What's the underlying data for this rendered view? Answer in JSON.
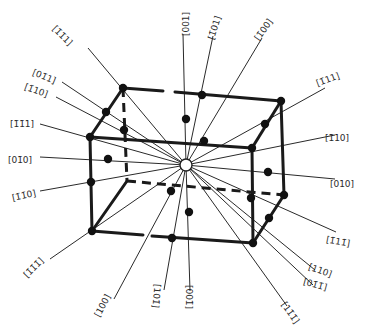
{
  "diagram": {
    "center": {
      "x": 186,
      "y": 165
    },
    "box": {
      "vertices": {
        "back_top_left": [
          123,
          88
        ],
        "back_top_right": [
          281,
          101
        ],
        "front_top_left": [
          90,
          137
        ],
        "front_top_right": [
          252,
          148
        ],
        "front_bottom_left": [
          92,
          231
        ],
        "front_bottom_right": [
          253,
          243
        ],
        "back_bottom_right": [
          284,
          195
        ],
        "back_bottom_left": [
          127,
          181
        ]
      }
    },
    "directions": [
      {
        "label": "[1̄1̄1]",
        "end": [
          88,
          48
        ],
        "lx": 62,
        "ly": 36,
        "rot": 45
      },
      {
        "label": "[01̄1]",
        "end": [
          62,
          82
        ],
        "lx": 44,
        "ly": 77,
        "rot": 22
      },
      {
        "label": "[1̄10]",
        "end": [
          56,
          97
        ],
        "lx": 36,
        "ly": 91,
        "rot": 20
      },
      {
        "label": "[1̄1̄1]",
        "end": [
          40,
          124
        ],
        "lx": 22,
        "ly": 124,
        "rot": 0
      },
      {
        "label": "[01̄0]",
        "end": [
          40,
          157
        ],
        "lx": 20,
        "ly": 160,
        "rot": 0
      },
      {
        "label": "[1̄1̄0]",
        "end": [
          40,
          191
        ],
        "lx": 24,
        "ly": 196,
        "rot": -12
      },
      {
        "label": "[1̄1̄1̄]",
        "end": [
          50,
          259
        ],
        "lx": 34,
        "ly": 268,
        "rot": -45
      },
      {
        "label": "[100]",
        "end": [
          114,
          299
        ],
        "lx": 103,
        "ly": 306,
        "rot": -62
      },
      {
        "label": "[101̄]",
        "end": [
          164,
          290
        ],
        "lx": 156,
        "ly": 296,
        "rot": 95
      },
      {
        "label": "[001̄]",
        "end": [
          190,
          291
        ],
        "lx": 188,
        "ly": 297,
        "rot": 90
      },
      {
        "label": "[11̄1̄]",
        "end": [
          287,
          306
        ],
        "lx": 290,
        "ly": 313,
        "rot": 55
      },
      {
        "label": "[01̄1̄]",
        "end": [
          313,
          285
        ],
        "lx": 315,
        "ly": 285,
        "rot": 15
      },
      {
        "label": "[110]",
        "end": [
          315,
          270
        ],
        "lx": 320,
        "ly": 271,
        "rot": 20
      },
      {
        "label": "[1̄11̄]",
        "end": [
          336,
          232
        ],
        "lx": 338,
        "ly": 242,
        "rot": 10
      },
      {
        "label": "[010]",
        "end": [
          335,
          179
        ],
        "lx": 342,
        "ly": 184,
        "rot": 0
      },
      {
        "label": "[1̄10]",
        "end": [
          335,
          135
        ],
        "lx": 337,
        "ly": 138,
        "rot": 0
      },
      {
        "label": "[1̄11]",
        "end": [
          325,
          88
        ],
        "lx": 328,
        "ly": 80,
        "rot": -20
      },
      {
        "label": "[1̄00]",
        "end": [
          262,
          38
        ],
        "lx": 264,
        "ly": 30,
        "rot": -55
      },
      {
        "label": "[1̄01]",
        "end": [
          213,
          36
        ],
        "lx": 215,
        "ly": 28,
        "rot": -72
      },
      {
        "label": "[001]",
        "end": [
          183,
          34
        ],
        "lx": 186,
        "ly": 24,
        "rot": -90
      }
    ],
    "nodes": [
      [
        123,
        88
      ],
      [
        281,
        101
      ],
      [
        90,
        137
      ],
      [
        252,
        148
      ],
      [
        92,
        231
      ],
      [
        253,
        243
      ],
      [
        284,
        195
      ],
      [
        106,
        112
      ],
      [
        202,
        95
      ],
      [
        124,
        130
      ],
      [
        265,
        124
      ],
      [
        186,
        119
      ],
      [
        204,
        141
      ],
      [
        108,
        159
      ],
      [
        268,
        172
      ],
      [
        91,
        182
      ],
      [
        171,
        191
      ],
      [
        189,
        212
      ],
      [
        172,
        238
      ],
      [
        269,
        218
      ],
      [
        251,
        198
      ]
    ]
  }
}
